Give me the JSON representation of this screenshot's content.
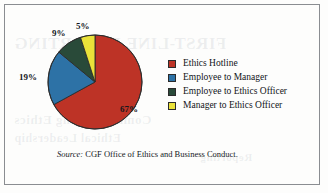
{
  "figure": {
    "source_label": "Source:",
    "source_text": " CGF Office of Ethics and Business Conduct."
  },
  "bleed_through": {
    "line1": "FIRST-LINE REPORTING",
    "line2": "Communicating Ethics",
    "line3": "Ethical Leadership",
    "line4": "Reporting"
  },
  "chart_data": {
    "type": "pie",
    "title": "",
    "categories": [
      "Ethics Hotline",
      "Employee to Manager",
      "Employee to Ethics Officer",
      "Manager to Ethics Officer"
    ],
    "values": [
      67,
      19,
      9,
      5
    ],
    "value_labels": [
      "67%",
      "19%",
      "9%",
      "5%"
    ],
    "colors": [
      "#bd3326",
      "#2d72a6",
      "#294a39",
      "#eae239"
    ],
    "units": "percent",
    "start_angle_deg": 0,
    "direction": "clockwise",
    "legend_position": "right",
    "grid": false
  }
}
